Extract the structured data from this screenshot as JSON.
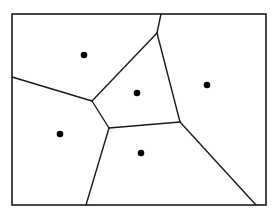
{
  "diagram": {
    "type": "voronoi",
    "width": 276,
    "height": 215,
    "stroke_color": "#1a1a1a",
    "point_color": "#000000",
    "border": {
      "x": 12,
      "y": 14,
      "width": 254,
      "height": 191
    },
    "sites": [
      {
        "id": "site-top-left",
        "x": 84,
        "y": 55
      },
      {
        "id": "site-center",
        "x": 137,
        "y": 93
      },
      {
        "id": "site-right",
        "x": 207,
        "y": 85
      },
      {
        "id": "site-bottom-left",
        "x": 60,
        "y": 134
      },
      {
        "id": "site-bottom-center",
        "x": 141,
        "y": 153
      }
    ],
    "edges": [
      {
        "x1": 161,
        "y1": 14,
        "x2": 157,
        "y2": 33
      },
      {
        "x1": 157,
        "y1": 33,
        "x2": 92,
        "y2": 101
      },
      {
        "x1": 12,
        "y1": 77,
        "x2": 92,
        "y2": 101
      },
      {
        "x1": 92,
        "y1": 101,
        "x2": 109,
        "y2": 128
      },
      {
        "x1": 157,
        "y1": 33,
        "x2": 180,
        "y2": 122
      },
      {
        "x1": 109,
        "y1": 128,
        "x2": 180,
        "y2": 122
      },
      {
        "x1": 109,
        "y1": 128,
        "x2": 86,
        "y2": 205
      },
      {
        "x1": 180,
        "y1": 122,
        "x2": 256,
        "y2": 205
      }
    ]
  }
}
